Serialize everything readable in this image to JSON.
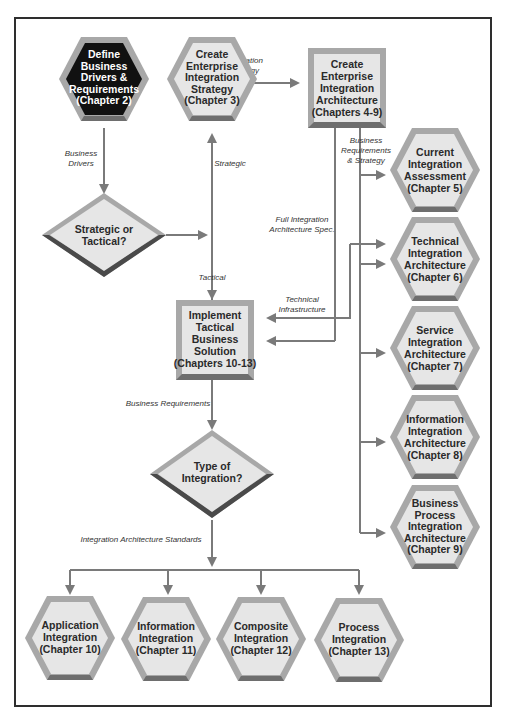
{
  "diagram": {
    "nodes": {
      "define": {
        "shape": "hexagon",
        "style": "dark",
        "lines": [
          "Define",
          "Business",
          "Drivers &",
          "Requirements",
          "(Chapter 2)"
        ]
      },
      "strategy": {
        "shape": "hexagon",
        "style": "light",
        "lines": [
          "Create",
          "Enterprise",
          "Integration",
          "Strategy",
          "(Chapter 3)"
        ]
      },
      "architecture": {
        "shape": "box",
        "style": "light",
        "lines": [
          "Create",
          "Enterprise",
          "Integration",
          "Architecture",
          "(Chapters 4-9)"
        ]
      },
      "decision_strategic": {
        "shape": "diamond",
        "lines": [
          "Strategic or",
          "Tactical?"
        ]
      },
      "implement": {
        "shape": "box",
        "style": "light",
        "lines": [
          "Implement",
          "Tactical",
          "Business",
          "Solution",
          "(Chapters 10-13)"
        ]
      },
      "decision_type": {
        "shape": "diamond",
        "lines": [
          "Type of",
          "Integration?"
        ]
      },
      "current": {
        "shape": "hexagon",
        "lines": [
          "Current",
          "Integration",
          "Assessment",
          "(Chapter 5)"
        ]
      },
      "technical": {
        "shape": "hexagon",
        "lines": [
          "Technical",
          "Integration",
          "Architecture",
          "(Chapter 6)"
        ]
      },
      "service": {
        "shape": "hexagon",
        "lines": [
          "Service",
          "Integration",
          "Architecture",
          "(Chapter 7)"
        ]
      },
      "information_arch": {
        "shape": "hexagon",
        "lines": [
          "Information",
          "Integration",
          "Architecture",
          "(Chapter 8)"
        ]
      },
      "business_process": {
        "shape": "hexagon",
        "lines": [
          "Business",
          "Process",
          "Integration",
          "Architecture",
          "(Chapter 9)"
        ]
      },
      "application": {
        "shape": "hexagon",
        "lines": [
          "Application",
          "Integration",
          "(Chapter 10)"
        ]
      },
      "information": {
        "shape": "hexagon",
        "lines": [
          "Information",
          "Integration",
          "(Chapter 11)"
        ]
      },
      "composite": {
        "shape": "hexagon",
        "lines": [
          "Composite",
          "Integration",
          "(Chapter 12)"
        ]
      },
      "process": {
        "shape": "hexagon",
        "lines": [
          "Process",
          "Integration",
          "(Chapter 13)"
        ]
      }
    },
    "edge_labels": {
      "business_drivers": [
        "Business",
        "Drivers"
      ],
      "integration_strategy": [
        "Integration",
        "Strategy"
      ],
      "strategic": [
        "Strategic"
      ],
      "tactical": [
        "Tactical"
      ],
      "business_req_strategy": [
        "Business",
        "Requirements",
        "& Strategy"
      ],
      "full_spec": [
        "Full Integration",
        "Architecture Spec."
      ],
      "technical_infrastructure": [
        "Technical",
        "Infrastructure"
      ],
      "business_requirements": [
        "Business Requirements"
      ],
      "standards": [
        "Integration Architecture Standards"
      ]
    },
    "colors": {
      "hex_fill": "#e6e6e6",
      "hex_border": "#a8a8a8",
      "hex_shadow": "#6e6e6e",
      "dark_fill": "#111111",
      "connector": "#7a7a7a",
      "frame": "#2e2e2e"
    }
  }
}
